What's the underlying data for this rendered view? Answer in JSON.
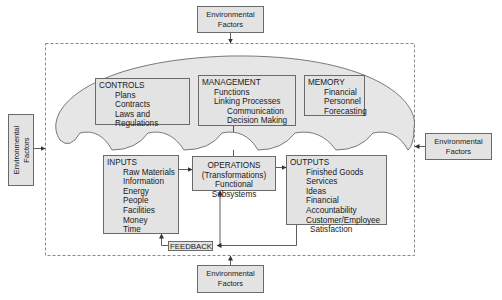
{
  "environment": {
    "top": {
      "line1": "Environmental",
      "line2": "Factors"
    },
    "left": {
      "line1": "Environmental",
      "line2": "Factors"
    },
    "right": {
      "line1": "Environmental",
      "line2": "Factors"
    },
    "bottom": {
      "line1": "Environmental",
      "line2": "Factors"
    }
  },
  "controls": {
    "title": "CONTROLS",
    "items": [
      "Plans",
      "Contracts",
      "Laws and Regulations"
    ]
  },
  "management": {
    "title": "MANAGEMENT",
    "items": [
      "Functions",
      "Linking Processes"
    ],
    "subitems": [
      "Communication",
      "Decision Making"
    ]
  },
  "memory": {
    "title": "MEMORY",
    "items": [
      "Financial",
      "Personnel",
      "Forecasting"
    ]
  },
  "inputs": {
    "title": "INPUTS",
    "items": [
      "Raw Materials",
      "Information",
      "Energy",
      "People",
      "Facilities",
      "Money",
      "Time"
    ]
  },
  "operations": {
    "line1": "OPERATIONS",
    "line2": "(Transformations)",
    "line3": "Functional Subsystems"
  },
  "outputs": {
    "title": "OUTPUTS",
    "items": [
      "Finished Goods",
      "Services",
      "Ideas",
      "Financial Accountability",
      "Customer/Employee"
    ],
    "continuation": "Satisfaction"
  },
  "feedback": {
    "label": "FEEDBACK"
  },
  "colors": {
    "box_fill": "#e3e3e3",
    "cloud_fill": "#e6e6e6",
    "stroke": "#6a6a6a",
    "dashed_boundary": "#8a8a8a"
  }
}
